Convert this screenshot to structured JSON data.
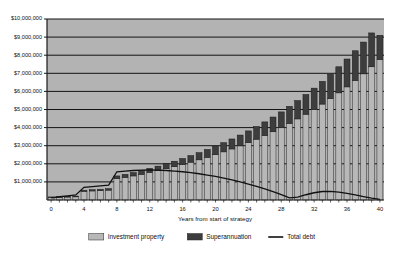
{
  "chart_data": {
    "type": "bar",
    "subtype": "stacked-bar-with-line-overlay",
    "title": "",
    "xlabel": "Years from start of strategy",
    "ylabel": "",
    "xlim": [
      0,
      40
    ],
    "ylim": [
      0,
      10000000
    ],
    "grid": true,
    "grid_orientation": "horizontal",
    "plot_background": "#b3b3b3",
    "legend_position": "bottom",
    "x_tick_labels": [
      "0",
      "4",
      "8",
      "12",
      "16",
      "20",
      "24",
      "28",
      "32",
      "36",
      "40"
    ],
    "x_tick_values": [
      0,
      4,
      8,
      12,
      16,
      20,
      24,
      28,
      32,
      36,
      40
    ],
    "y_tick_labels": [
      "$10,000,000",
      "$9,000,000",
      "$8,000,000",
      "$7,000,000",
      "$6,000,000",
      "$5,000,000",
      "$4,000,000",
      "$3,000,000",
      "$2,000,000",
      "$1,000,000"
    ],
    "y_tick_values": [
      10000000,
      9000000,
      8000000,
      7000000,
      6000000,
      5000000,
      4000000,
      3000000,
      2000000,
      1000000
    ],
    "categories": [
      0,
      1,
      2,
      3,
      4,
      5,
      6,
      7,
      8,
      9,
      10,
      11,
      12,
      13,
      14,
      15,
      16,
      17,
      18,
      19,
      20,
      21,
      22,
      23,
      24,
      25,
      26,
      27,
      28,
      29,
      30,
      31,
      32,
      33,
      34,
      35,
      36,
      37,
      38,
      39,
      40
    ],
    "series": [
      {
        "name": "Investment property",
        "kind": "bar",
        "stack": "assets",
        "color": "#b8b8b8",
        "edge_color": "#2b2b2b",
        "values": [
          140000,
          150000,
          162000,
          175000,
          480000,
          500000,
          520000,
          545000,
          1180000,
          1250000,
          1330000,
          1420000,
          1520000,
          1620000,
          1730000,
          1840000,
          1960000,
          2090000,
          2220000,
          2360000,
          2500000,
          2660000,
          2820000,
          2990000,
          3170000,
          3360000,
          3560000,
          3770000,
          3990000,
          4230000,
          4480000,
          4740000,
          5010000,
          5300000,
          5600000,
          5920000,
          6250000,
          6600000,
          6970000,
          7360000,
          7760000
        ]
      },
      {
        "name": "Superannuation",
        "kind": "bar",
        "stack": "assets",
        "color": "#3d3d3d",
        "edge_color": "#1a1a1a",
        "values": [
          30000,
          34000,
          38000,
          43000,
          60000,
          68000,
          76000,
          85000,
          150000,
          168000,
          186000,
          206000,
          228000,
          251000,
          276000,
          303000,
          332000,
          363000,
          396000,
          431000,
          469000,
          509000,
          552000,
          598000,
          647000,
          699000,
          755000,
          814000,
          877000,
          944000,
          1015000,
          1090000,
          1170000,
          1255000,
          1345000,
          1440000,
          1540000,
          1645000,
          1755000,
          1870000,
          1340000
        ]
      },
      {
        "name": "Total debt",
        "kind": "line",
        "color": "#111111",
        "values": [
          120000,
          180000,
          230000,
          280000,
          700000,
          740000,
          780000,
          820000,
          1560000,
          1600000,
          1630000,
          1650000,
          1660000,
          1650000,
          1630000,
          1600000,
          1560000,
          1510000,
          1450000,
          1380000,
          1300000,
          1210000,
          1110000,
          1000000,
          880000,
          750000,
          610000,
          460000,
          300000,
          120000,
          160000,
          290000,
          400000,
          470000,
          480000,
          440000,
          370000,
          280000,
          190000,
          100000,
          30000
        ]
      }
    ],
    "legend": [
      {
        "label": "Investment property",
        "marker": "swatch",
        "color": "#b8b8b8"
      },
      {
        "label": "Superannuation",
        "marker": "swatch",
        "color": "#3d3d3d"
      },
      {
        "label": "Total debt",
        "marker": "line",
        "color": "#111111"
      }
    ]
  }
}
